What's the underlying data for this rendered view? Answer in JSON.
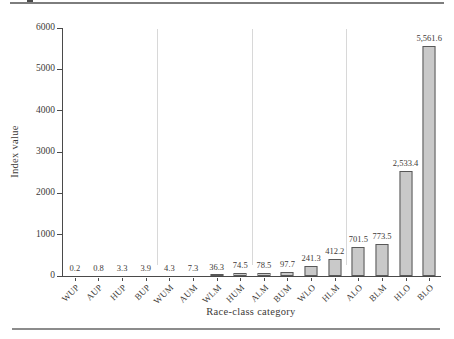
{
  "figure": {
    "type": "printed-book-figure",
    "background": "#ffffff",
    "top_rule_color": "#7d7d7d",
    "bottom_rule_color": "#8c8c8c"
  },
  "chart_data": {
    "type": "bar",
    "title": "",
    "xlabel": "Race-class category",
    "ylabel": "Index value",
    "categories": [
      "WUP",
      "AUP",
      "HUP",
      "BUP",
      "WUM",
      "AUM",
      "WLM",
      "HUM",
      "ALM",
      "BUM",
      "WLO",
      "HLM",
      "ALO",
      "BLM",
      "HLO",
      "BLO"
    ],
    "values": [
      0.2,
      0.8,
      3.3,
      3.9,
      4.3,
      7.3,
      36.3,
      74.5,
      78.5,
      97.7,
      241.3,
      412.2,
      701.5,
      773.5,
      2533.4,
      5561.6
    ],
    "value_labels": [
      "0.2",
      "0.8",
      "3.3",
      "3.9",
      "4.3",
      "7.3",
      "36.3",
      "74.5",
      "78.5",
      "97.7",
      "241.3",
      "412.2",
      "701.5",
      "773.5",
      "2,533.4",
      "5,561.6"
    ],
    "ylim": [
      0,
      6000
    ],
    "yticks": [
      0,
      1000,
      2000,
      3000,
      4000,
      5000,
      6000
    ],
    "ytick_labels": [
      "0",
      "1000",
      "2000",
      "3000",
      "4000",
      "5000",
      "6000"
    ],
    "group_separators_after": [
      4,
      8,
      12
    ],
    "grid": false,
    "legend": false,
    "bar_fill_color": "#c9c9c9",
    "bar_border_color": "#585858",
    "separator_color": "#d8d8d8",
    "axis_color": "#4a4a4a",
    "text_color": "#3d3a37"
  }
}
